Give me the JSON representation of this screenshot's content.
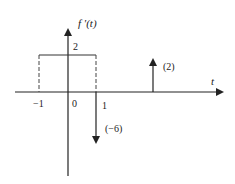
{
  "diagram": {
    "type": "signal-plot",
    "y_axis_label": "f '(t)",
    "x_axis_label": "t",
    "x_ticks": [
      {
        "value": -1,
        "label": "−1"
      },
      {
        "value": 0,
        "label": "0"
      },
      {
        "value": 1,
        "label": "1"
      }
    ],
    "rect_pulse": {
      "from": -1,
      "to": 1,
      "height": 2,
      "height_label": "2"
    },
    "impulses": [
      {
        "at": 1,
        "weight": -6,
        "label": "(−6)"
      },
      {
        "at": 3,
        "weight": 2,
        "label": "(2)"
      }
    ]
  }
}
